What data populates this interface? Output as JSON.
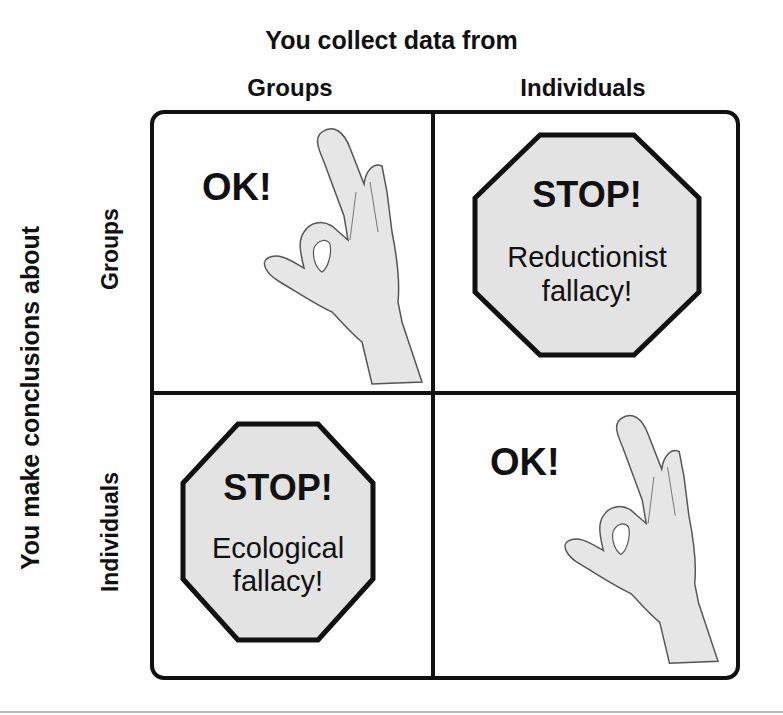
{
  "diagram": {
    "top_axis_title": "You collect data from",
    "columns": [
      {
        "label": "Groups"
      },
      {
        "label": "Individuals"
      }
    ],
    "left_axis_title": "You make conclusions about",
    "rows": [
      {
        "label": "Groups"
      },
      {
        "label": "Individuals"
      }
    ],
    "cells": [
      {
        "row": "Groups",
        "col": "Groups",
        "type": "ok",
        "text": "OK!",
        "icon": "ok-hand-icon"
      },
      {
        "row": "Groups",
        "col": "Individuals",
        "type": "stop",
        "title": "STOP!",
        "line1": "Reductionist",
        "line2": "fallacy!",
        "icon": "stop-sign-icon"
      },
      {
        "row": "Individuals",
        "col": "Groups",
        "type": "stop",
        "title": "STOP!",
        "line1": "Ecological",
        "line2": "fallacy!",
        "icon": "stop-sign-icon"
      },
      {
        "row": "Individuals",
        "col": "Individuals",
        "type": "ok",
        "text": "OK!",
        "icon": "ok-hand-icon"
      }
    ],
    "colors": {
      "border": "#111111",
      "sign_fill": "#e3e3e3",
      "hand_fill": "#e6e6e6",
      "hand_stroke": "#555555"
    }
  }
}
